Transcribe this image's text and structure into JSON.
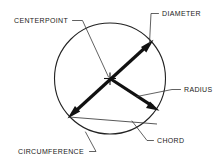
{
  "diagram": {
    "background_color": "#ffffff",
    "line_color": "#111111",
    "text_color": "#1a1a1a",
    "shape": {
      "name": "circle",
      "center_x": 110,
      "center_y": 78.5,
      "radius": 55.5
    },
    "labels": {
      "centerpoint": "CENTERPOINT",
      "diameter": "DIAMETER",
      "radius": "RADIUS",
      "chord": "CHORD",
      "circumference": "CIRCUMFERENCE"
    },
    "elements": [
      {
        "id": "centerpoint",
        "label": "CENTERPOINT",
        "kind": "point",
        "marker": "cross-tick",
        "at": [
          110,
          78.5
        ]
      },
      {
        "id": "diameter",
        "label": "DIAMETER",
        "kind": "double-arrow-segment",
        "from": [
          69,
          117
        ],
        "to": [
          152,
          41
        ],
        "passes_through_center": true
      },
      {
        "id": "radius",
        "label": "RADIUS",
        "kind": "arrow-segment",
        "from": [
          110,
          78.5
        ],
        "to": [
          158,
          110
        ]
      },
      {
        "id": "chord",
        "label": "CHORD",
        "kind": "segment",
        "from": [
          69,
          117
        ],
        "to": [
          157,
          124
        ]
      },
      {
        "id": "circumference",
        "label": "CIRCUMFERENCE",
        "kind": "arc-outline",
        "points_to": [
          82,
          131
        ]
      }
    ]
  }
}
